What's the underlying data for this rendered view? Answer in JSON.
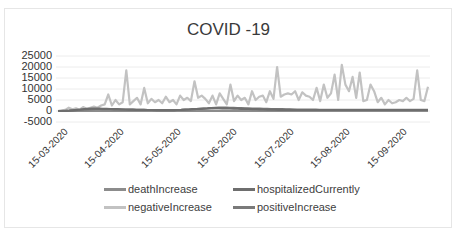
{
  "chart_data": {
    "type": "line",
    "title": "COVID -19",
    "xlabel": "",
    "ylabel": "",
    "ylim": [
      -5000,
      25000
    ],
    "yticks": [
      25000,
      20000,
      15000,
      10000,
      5000,
      0,
      -5000
    ],
    "xticks": [
      "15-03-2020",
      "15-04-2020",
      "15-05-2020",
      "15-06-2020",
      "15-07-2020",
      "15-08-2020",
      "15-09-2020"
    ],
    "grid": true,
    "legend_position": "bottom",
    "x_start": "07-03-2020",
    "x_step_days": 2,
    "series": [
      {
        "name": "deathIncrease",
        "color": "#8c8c8c",
        "values": [
          0,
          0,
          5,
          10,
          20,
          30,
          40,
          50,
          60,
          60,
          70,
          60,
          50,
          50,
          40,
          40,
          35,
          30,
          30,
          25,
          25,
          20,
          20,
          20,
          15,
          15,
          15,
          15,
          15,
          15,
          10,
          10,
          10,
          10,
          10,
          10,
          10,
          15,
          15,
          20,
          20,
          25,
          25,
          30,
          30,
          30,
          30,
          25,
          25,
          25,
          20,
          20,
          20,
          20,
          20,
          20,
          20,
          20,
          20,
          20,
          20,
          20,
          20,
          20,
          20,
          15,
          15,
          15,
          15,
          15,
          15,
          15,
          15,
          15,
          15,
          15,
          15,
          15,
          15,
          15,
          15,
          15,
          15,
          15,
          15,
          15,
          15,
          15,
          15,
          15,
          15,
          15,
          15,
          15,
          15,
          15,
          15,
          15,
          15
        ]
      },
      {
        "name": "hospitalizedCurrently",
        "color": "#6e6e6e",
        "values": [
          0,
          0,
          50,
          150,
          300,
          500,
          700,
          900,
          1000,
          1100,
          1100,
          1050,
          1000,
          950,
          900,
          850,
          800,
          750,
          700,
          650,
          600,
          550,
          500,
          500,
          450,
          450,
          400,
          400,
          400,
          400,
          400,
          400,
          450,
          500,
          600,
          700,
          800,
          900,
          1000,
          1100,
          1200,
          1300,
          1300,
          1300,
          1250,
          1200,
          1150,
          1100,
          1050,
          1000,
          950,
          900,
          850,
          800,
          750,
          700,
          650,
          600,
          600,
          550,
          550,
          500,
          500,
          500,
          450,
          450,
          450,
          450,
          450,
          450,
          450,
          450,
          450,
          450,
          450,
          450,
          450,
          450,
          450,
          450,
          450,
          450,
          450,
          450,
          450,
          450,
          450,
          450,
          450,
          450,
          450,
          450,
          450,
          450,
          450,
          450,
          450,
          450,
          450,
          450
        ]
      },
      {
        "name": "negativeIncrease",
        "color": "#c2c2c2",
        "values": [
          0,
          200,
          500,
          1500,
          800,
          1200,
          600,
          1800,
          1000,
          1500,
          2000,
          1500,
          2500,
          3000,
          7500,
          2500,
          5000,
          3000,
          4000,
          18500,
          3000,
          4500,
          6000,
          3000,
          10500,
          3500,
          5500,
          4000,
          5000,
          3500,
          6500,
          4000,
          5000,
          3000,
          7000,
          5000,
          6000,
          4500,
          13500,
          6000,
          7000,
          5500,
          3500,
          7000,
          3000,
          8000,
          5500,
          3000,
          12000,
          4500,
          7000,
          5000,
          6000,
          3000,
          9000,
          5000,
          6500,
          7000,
          4000,
          9000,
          5500,
          20000,
          6500,
          7500,
          8000,
          7500,
          9000,
          5000,
          8500,
          7000,
          6500,
          5000,
          10500,
          4500,
          12000,
          6000,
          8000,
          16500,
          5000,
          21000,
          12000,
          9000,
          15500,
          6000,
          17500,
          4500,
          5000,
          12000,
          9000,
          4000,
          6000,
          3000,
          5000,
          3500,
          4000,
          5000,
          4500,
          6000,
          4500,
          5500,
          18500,
          5000,
          4500,
          11000
        ]
      },
      {
        "name": "positiveIncrease",
        "color": "#7a7a7a",
        "values": [
          0,
          50,
          100,
          200,
          300,
          400,
          500,
          600,
          700,
          800,
          900,
          900,
          850,
          800,
          800,
          750,
          700,
          700,
          650,
          600,
          600,
          550,
          500,
          500,
          450,
          450,
          450,
          400,
          400,
          400,
          400,
          400,
          450,
          500,
          600,
          700,
          800,
          900,
          1000,
          1100,
          1200,
          1300,
          1400,
          1500,
          1500,
          1500,
          1450,
          1400,
          1350,
          1300,
          1250,
          1200,
          1150,
          1100,
          1050,
          1000,
          950,
          900,
          850,
          800,
          800,
          750,
          750,
          700,
          700,
          650,
          650,
          600,
          600,
          600,
          550,
          550,
          550,
          500,
          500,
          500,
          500,
          500,
          500,
          500,
          500,
          500,
          500,
          500,
          500,
          500,
          500,
          500,
          500,
          500,
          500,
          500,
          500,
          500,
          500,
          500,
          500,
          500,
          500,
          500
        ]
      }
    ]
  },
  "legend": {
    "items": [
      {
        "label": "deathIncrease",
        "color": "#8c8c8c"
      },
      {
        "label": "hospitalizedCurrently",
        "color": "#6e6e6e"
      },
      {
        "label": "negativeIncrease",
        "color": "#c2c2c2"
      },
      {
        "label": "positiveIncrease",
        "color": "#7a7a7a"
      }
    ]
  }
}
